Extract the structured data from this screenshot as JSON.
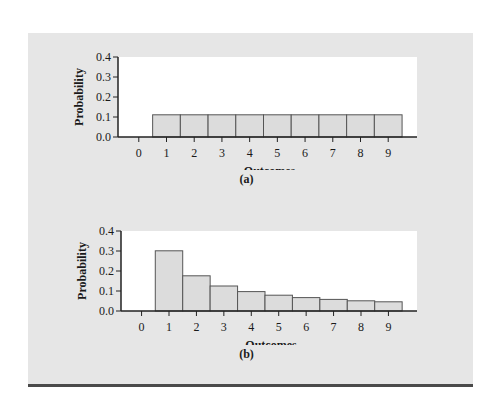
{
  "chart_data": [
    {
      "type": "bar",
      "panel_label": "(a)",
      "title": "",
      "xlabel": "Outcomes",
      "ylabel": "Probability",
      "categories": [
        "0",
        "1",
        "2",
        "3",
        "4",
        "5",
        "6",
        "7",
        "8",
        "9"
      ],
      "values": [
        0,
        0.111,
        0.111,
        0.111,
        0.111,
        0.111,
        0.111,
        0.111,
        0.111,
        0.111
      ],
      "ylim": [
        0,
        0.4
      ],
      "yticks": [
        "0.0",
        "0.1",
        "0.2",
        "0.3",
        "0.4"
      ],
      "grid": false,
      "legend": null,
      "bar_color": "#dcdcdc",
      "plot_bg": "#ffffff"
    },
    {
      "type": "bar",
      "panel_label": "(b)",
      "title": "",
      "xlabel": "Outcomes",
      "ylabel": "Probability",
      "categories": [
        "0",
        "1",
        "2",
        "3",
        "4",
        "5",
        "6",
        "7",
        "8",
        "9"
      ],
      "values": [
        0,
        0.301,
        0.176,
        0.125,
        0.097,
        0.079,
        0.067,
        0.058,
        0.051,
        0.046
      ],
      "ylim": [
        0,
        0.4
      ],
      "yticks": [
        "0.0",
        "0.1",
        "0.2",
        "0.3",
        "0.4"
      ],
      "grid": false,
      "legend": null,
      "bar_color": "#dcdcdc",
      "plot_bg": "#ffffff"
    }
  ],
  "charts": {
    "a": {
      "xlabel": "Outcomes",
      "ylabel": "Probability",
      "caption": "(a)"
    },
    "b": {
      "xlabel": "Outcomes",
      "ylabel": "Probability",
      "caption": "(b)"
    }
  },
  "colors": {
    "panel_bg": "#e6e6e6",
    "bar_fill": "#dcdcdc",
    "bar_stroke": "#555555",
    "axis": "#222222",
    "rule": "#4a4a4a"
  }
}
